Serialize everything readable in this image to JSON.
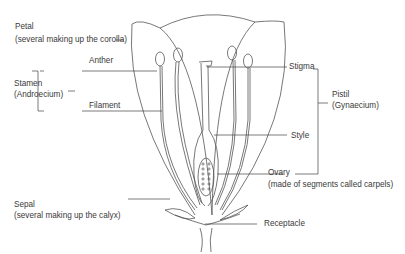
{
  "labels": {
    "petal": "Petal",
    "petal_note": "(several making up the corolla)",
    "stamen": "Stamen",
    "stamen_note": "(Androecium)",
    "anther": "Anther",
    "filament": "Filament",
    "stigma": "Stigma",
    "pistil": "Pistil",
    "pistil_note": "(Gynaecium)",
    "style": "Style",
    "ovary": "Ovary",
    "ovary_note": "(made of segments called carpels)",
    "sepal": "Sepal",
    "sepal_note": "(several making up the calyx)",
    "receptacle": "Receptacle"
  },
  "colors": {
    "line": "#444444",
    "text": "#3a3a3a"
  }
}
